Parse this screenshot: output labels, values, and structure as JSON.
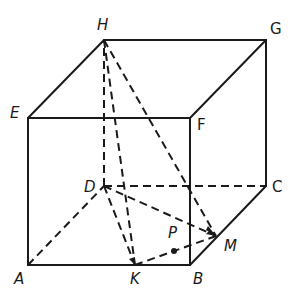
{
  "diagram": {
    "type": "cube-geometry",
    "stroke_color": "#1a1a1a",
    "vertices": {
      "A": {
        "label": "A",
        "x": 28,
        "y": 265
      },
      "B": {
        "label": "B",
        "x": 190,
        "y": 265
      },
      "C": {
        "label": "C",
        "x": 266,
        "y": 186
      },
      "D": {
        "label": "D",
        "x": 104,
        "y": 186
      },
      "E": {
        "label": "E",
        "x": 28,
        "y": 118
      },
      "F": {
        "label": "F",
        "x": 190,
        "y": 118
      },
      "G": {
        "label": "G",
        "x": 266,
        "y": 40
      },
      "H": {
        "label": "H",
        "x": 104,
        "y": 40
      },
      "K": {
        "label": "K",
        "x": 135,
        "y": 265
      },
      "M": {
        "label": "M",
        "x": 216,
        "y": 236
      },
      "P": {
        "label": "P",
        "x": 174,
        "y": 251
      }
    },
    "solid_edges": [
      "EH",
      "HG",
      "GF",
      "EF",
      "EA",
      "AB",
      "BF",
      "GC",
      "CB"
    ],
    "dashed_edges": [
      "AD",
      "DC",
      "DH",
      "HK",
      "HM",
      "DK",
      "DM",
      "KM"
    ]
  }
}
